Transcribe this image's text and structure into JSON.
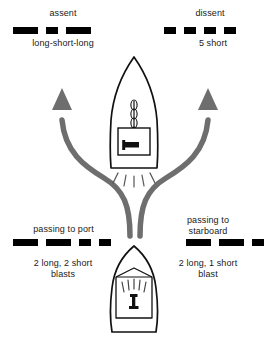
{
  "diagram": {
    "colors": {
      "signal_black": "#000000",
      "arrow_gray": "#6e6e6e",
      "hull_outline": "#111111",
      "background": "#ffffff"
    }
  },
  "signals": {
    "assent": {
      "title": "assent",
      "description": "long-short-long",
      "pattern": [
        "long",
        "short",
        "long"
      ]
    },
    "dissent": {
      "title": "dissent",
      "description": "5 short",
      "pattern": [
        "short",
        "short",
        "short",
        "short"
      ]
    },
    "passing_to_port": {
      "title": "passing to port",
      "description": "2 long, 2 short\nblasts",
      "pattern": [
        "long",
        "long",
        "short",
        "short"
      ]
    },
    "passing_to_starboard": {
      "title": "passing to\nstarboard",
      "description": "2 long, 1 short\nblast",
      "pattern": [
        "long",
        "long",
        "short"
      ]
    }
  },
  "vessels": {
    "upper": {
      "name": "upper-boat-bow-view",
      "description": "Vessel seen from above with mast and sounding horn emitting blast lines"
    },
    "lower": {
      "name": "lower-boat-stern-view",
      "description": "Vessel seen from astern with cabin horn emitting blast lines"
    }
  },
  "arrows": {
    "port_arrow": {
      "name": "port-course-arrow",
      "direction": "up-left"
    },
    "starboard_arrow": {
      "name": "starboard-course-arrow",
      "direction": "up-right"
    }
  }
}
